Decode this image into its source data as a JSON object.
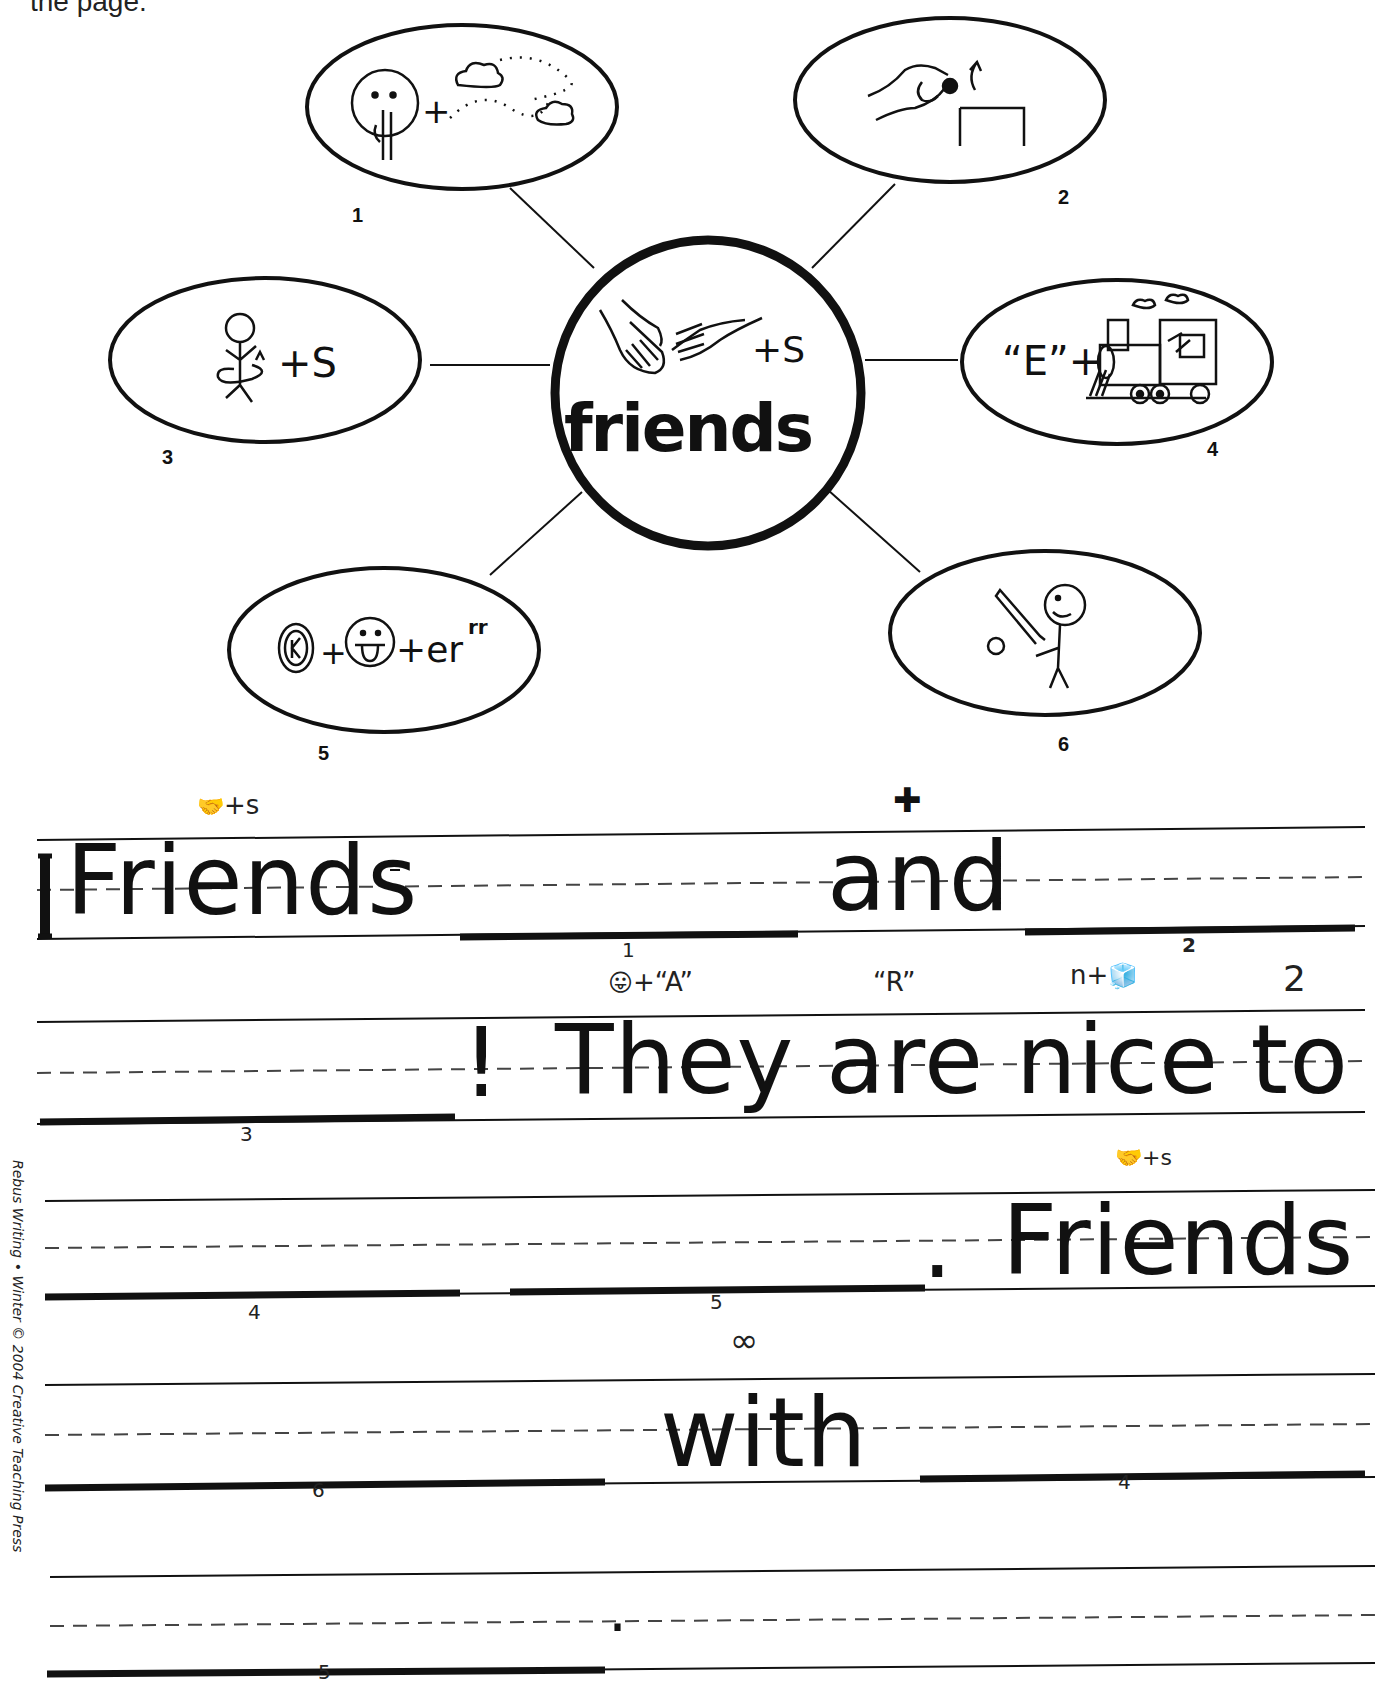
{
  "header": {
    "cut_text": "the page."
  },
  "web": {
    "center": {
      "word": "friends",
      "symbol": "shaking-hands-icon",
      "suffix": "+S"
    },
    "nodes": [
      {
        "number": "1",
        "symbols": [
          "shush-face-icon",
          "+",
          "clouds-wind-icon"
        ]
      },
      {
        "number": "2",
        "symbols": [
          "hand-dropping-into-box-icon"
        ]
      },
      {
        "number": "3",
        "symbols": [
          "stick-figure-turning-icon"
        ],
        "suffix": "+S"
      },
      {
        "number": "4",
        "prefix": "“E”+",
        "symbols": [
          "train-icon"
        ]
      },
      {
        "number": "5",
        "symbols": [
          "k-circle-icon",
          "+",
          "tongue-face-icon"
        ],
        "suffix": "+er",
        "superscript": "rr"
      },
      {
        "number": "6",
        "symbols": [
          "batter-stick-figure-icon"
        ]
      }
    ]
  },
  "sentences": {
    "line1": {
      "rebus_above": "+s",
      "cross_mark": "✚",
      "word_friends": "Friends",
      "word_and": "and",
      "blank1_number": "1",
      "blank2_number": "2"
    },
    "line2": {
      "rebus_tongue_a": "+“A”",
      "rebus_r": "“R”",
      "rebus_ice": "n+",
      "rebus_two": "2",
      "exclaim": "!",
      "text": "They are nice to",
      "blank3_number": "3"
    },
    "line3": {
      "rebus_above": "+s",
      "period": ".",
      "word_friends": "Friends",
      "blank4_number": "4",
      "blank5_number": "5"
    },
    "line4": {
      "rebus_above": "∞",
      "word_with": "with",
      "blank6_number": "6",
      "blank4_number": "4"
    },
    "line5": {
      "period": ".",
      "blank5_number": "5"
    }
  },
  "footer": {
    "credit": "Rebus Writing • Winter © 2004 Creative Teaching Press"
  }
}
